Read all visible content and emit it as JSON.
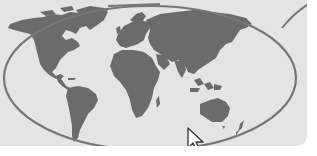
{
  "illustration": {
    "title": "World map with highlighted selection and mouse cursor",
    "colors": {
      "background": "#e4e4e4",
      "landmass": "#6b6b6b",
      "outline": "#777777",
      "cursor_fill": "#ffffff",
      "cursor_stroke": "#333333",
      "page": "#ffffff"
    },
    "elements": {
      "map": "world-map",
      "selection": "ellipse-outline",
      "connector": "callout-line",
      "pointer": "mouse-cursor-icon"
    }
  }
}
